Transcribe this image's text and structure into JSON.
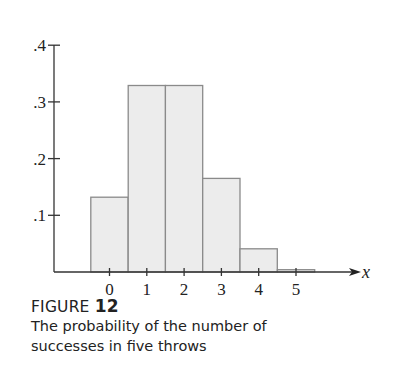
{
  "chart_data": {
    "type": "bar",
    "title": "FIGURE 12",
    "subtitle": "The probability of the number of successes in five throws",
    "xlabel": "x",
    "ylabel": "",
    "categories": [
      "0",
      "1",
      "2",
      "3",
      "4",
      "5"
    ],
    "values": [
      0.132,
      0.329,
      0.329,
      0.165,
      0.041,
      0.004
    ],
    "yticks": [
      ".1",
      ".2",
      ".3",
      ".4"
    ],
    "ytick_values": [
      0.1,
      0.2,
      0.3,
      0.4
    ],
    "ylim": [
      0,
      0.4
    ],
    "grid": false,
    "legend": null,
    "bar_fill": "#ececec",
    "bar_stroke": "#8a8a8a"
  },
  "caption": {
    "label": "FIGURE",
    "number": "12",
    "line1": "The probability of the number of",
    "line2": "successes in five throws"
  }
}
